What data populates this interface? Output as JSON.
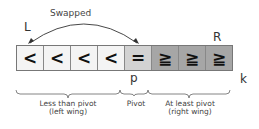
{
  "diagram": {
    "swap_label": "Swapped",
    "left_pointer": "L",
    "right_pointer": "R",
    "pivot_marker": "p",
    "end_marker": "k",
    "cells": [
      {
        "symbol": "<",
        "kind": "less"
      },
      {
        "symbol": "<",
        "kind": "less"
      },
      {
        "symbol": "<",
        "kind": "less"
      },
      {
        "symbol": "<",
        "kind": "less"
      },
      {
        "symbol": "=",
        "kind": "equal"
      },
      {
        "symbol": "≧",
        "kind": "ge"
      },
      {
        "symbol": "≧",
        "kind": "ge"
      },
      {
        "symbol": "≧",
        "kind": "ge"
      }
    ],
    "groups": [
      {
        "line1": "Less than pivot",
        "line2": "(left wing)"
      },
      {
        "line1": "Pivot",
        "line2": ""
      },
      {
        "line1": "At least pivot",
        "line2": "(right wing)"
      }
    ],
    "colors": {
      "less": "#f4f4f4",
      "equal": "#d2d2d2",
      "ge": "#a6a6a6"
    }
  }
}
